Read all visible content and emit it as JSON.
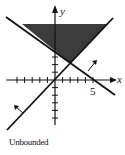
{
  "figure": {
    "type": "inequality-system-graph",
    "caption": "Unbounded",
    "axes": {
      "x_label": "x",
      "y_label": "y",
      "x_tick_label": "5"
    },
    "colors": {
      "line": "#111111",
      "shade": "#2a2a2a",
      "background": "#ffffff"
    },
    "lines": [
      {
        "name": "descending-boundary",
        "description": "line with negative slope crossing x-axis near x=5",
        "arrow_direction": "up-right"
      },
      {
        "name": "ascending-boundary",
        "description": "line with positive slope through origin",
        "arrow_direction": "up-left"
      }
    ],
    "feasible_region": "shaded unbounded region above both lines"
  }
}
